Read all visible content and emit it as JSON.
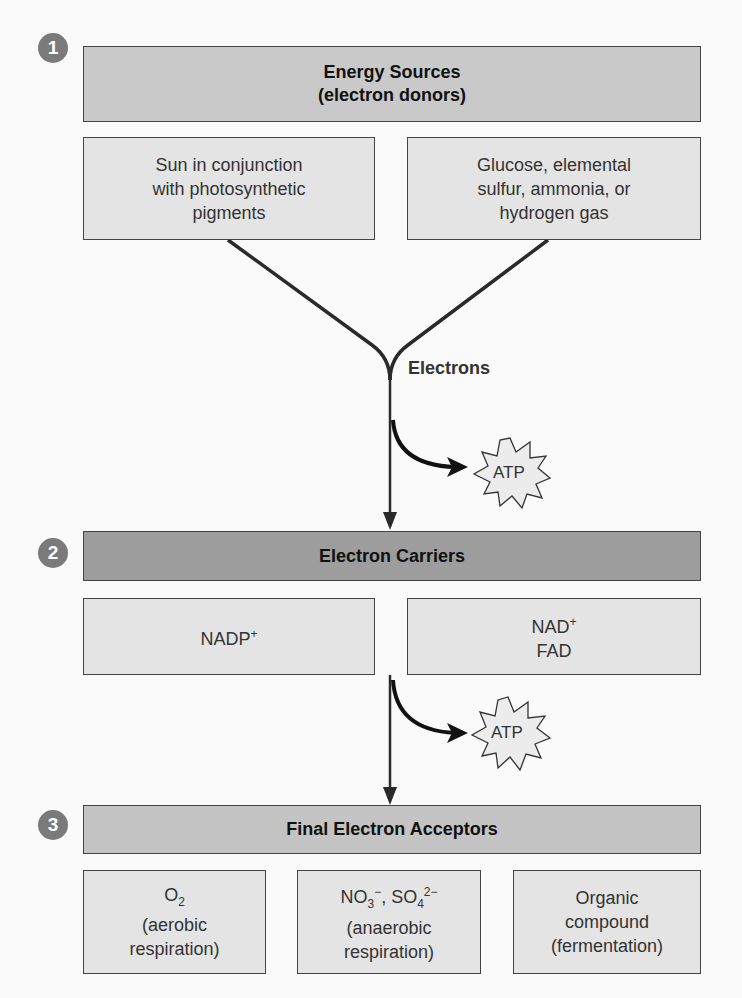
{
  "diagram": {
    "steps": [
      {
        "number": "1",
        "title_line1": "Energy Sources",
        "title_line2": "(electron donors)",
        "boxes": [
          {
            "lines": [
              "Sun in conjunction",
              "with photosynthetic",
              "pigments"
            ]
          },
          {
            "lines": [
              "Glucose, elemental",
              "sulfur, ammonia, or",
              "hydrogen gas"
            ]
          }
        ]
      },
      {
        "number": "2",
        "title": "Electron Carriers",
        "boxes": [
          {
            "lines": [
              "NADP+"
            ]
          },
          {
            "lines": [
              "NAD+",
              "FAD"
            ]
          }
        ]
      },
      {
        "number": "3",
        "title": "Final Electron Acceptors",
        "boxes": [
          {
            "lines": [
              "O2",
              "(aerobic",
              "respiration)"
            ]
          },
          {
            "lines": [
              "NO3−, SO42−",
              "(anaerobic",
              "respiration)"
            ]
          },
          {
            "lines": [
              "Organic",
              "compound",
              "(fermentation)"
            ]
          }
        ]
      }
    ],
    "flow_label": "Electrons",
    "atp_label_1": "ATP",
    "atp_label_2": "ATP",
    "colors": {
      "header1": "#c9c9c9",
      "header2": "#9d9d9d",
      "header3": "#c4c4c4",
      "box": "#e4e4e4",
      "badge": "#7a7a7a",
      "line": "#2a2a2a"
    }
  }
}
